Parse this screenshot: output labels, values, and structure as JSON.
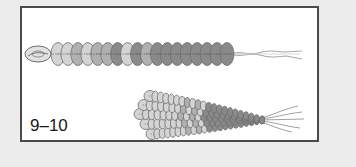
{
  "figure": {
    "label": "9–10",
    "colors": {
      "background": "#ececec",
      "panel": "#ffffff",
      "border": "#4a4a4a",
      "sequin_light": "#d4d4d4",
      "sequin_mid": "#b0b0b0",
      "sequin_dark": "#8a8a8a",
      "sequin_outline": "#6e6e6e",
      "wire": "#9a9a9a"
    },
    "strand_single": {
      "description": "single strand of stacked sequins with twisted wire tail",
      "sequin_count": 18,
      "shades": [
        "light",
        "light",
        "mid",
        "light",
        "mid",
        "mid",
        "dark",
        "light",
        "dark",
        "mid",
        "dark",
        "dark",
        "dark",
        "dark",
        "dark",
        "dark",
        "dark",
        "dark"
      ]
    },
    "strand_bundle": {
      "description": "bundle of multiple sequin strands gathered into tapered cluster with wire tails",
      "row_count": 5
    }
  }
}
